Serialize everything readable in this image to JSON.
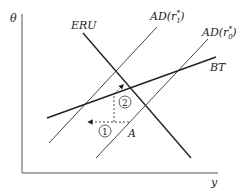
{
  "diagram": {
    "axes": {
      "y_label": "θ",
      "x_label": "y"
    },
    "curves": [
      {
        "id": "ERU",
        "label": "ERU"
      },
      {
        "id": "AD1",
        "label_main": "AD(r",
        "label_sup": "*",
        "label_sub": "1",
        "label_close": ")"
      },
      {
        "id": "AD0",
        "label_main": "AD(r",
        "label_sup": "*",
        "label_sub": "0",
        "label_close": ")"
      },
      {
        "id": "BT",
        "label": "BT"
      }
    ],
    "points": [
      {
        "id": "A",
        "label": "A"
      }
    ],
    "steps": [
      {
        "id": "step1",
        "label": "1"
      },
      {
        "id": "step2",
        "label": "2"
      }
    ]
  }
}
